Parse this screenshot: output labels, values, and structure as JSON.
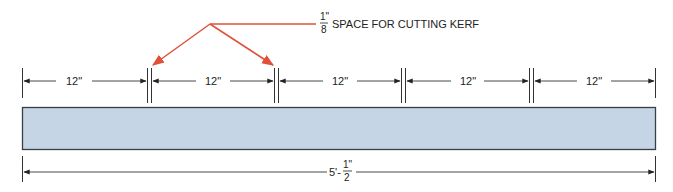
{
  "note": {
    "fraction_num": "1\"",
    "fraction_den": "8",
    "text": "SPACE FOR CUTTING KERF"
  },
  "segments": [
    {
      "label": "12\""
    },
    {
      "label": "12\""
    },
    {
      "label": "12\""
    },
    {
      "label": "12\""
    },
    {
      "label": "12\""
    }
  ],
  "total": {
    "whole": "5'-",
    "fraction_num": "1\"",
    "fraction_den": "2"
  },
  "colors": {
    "board_fill": "#c5d5e6",
    "board_stroke": "#3a3f45",
    "leader": "#e0503a",
    "line": "#333333"
  }
}
